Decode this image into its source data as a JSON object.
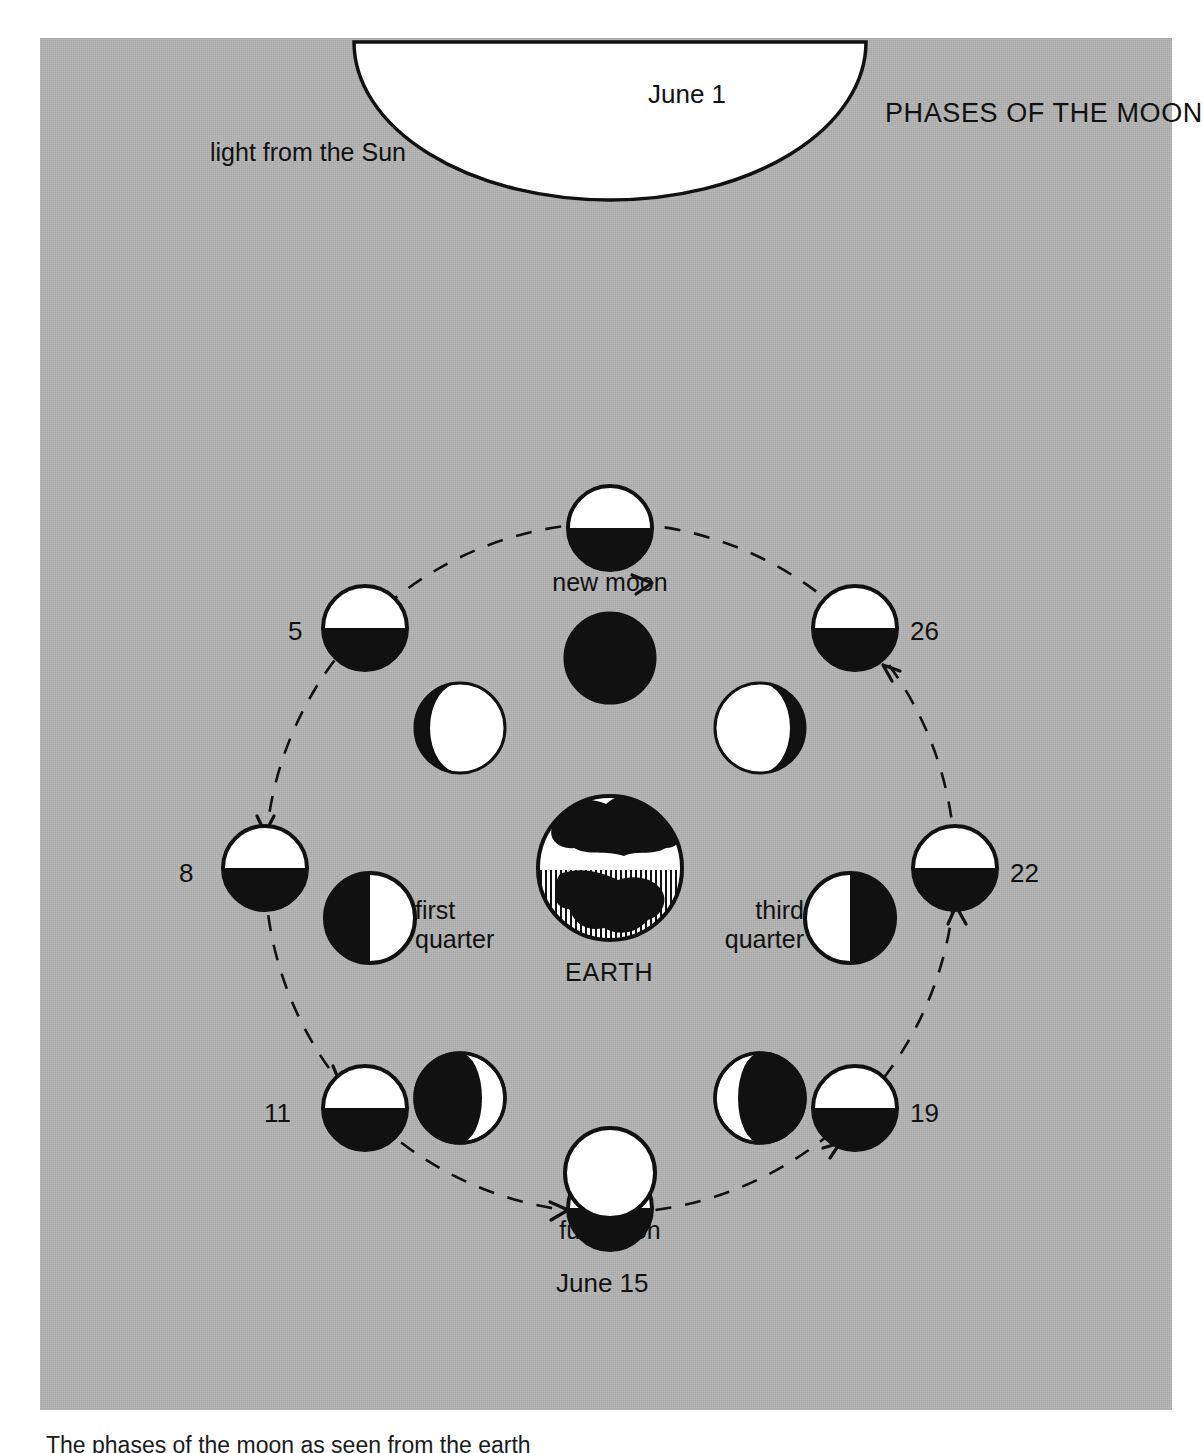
{
  "figure": {
    "title": "PHASES OF THE MOON",
    "sun_caption": "light from the Sun",
    "earth_label": "EARTH",
    "bottom_caption": "The phases of the moon as seen from the earth",
    "background_color": "#b3b3b3",
    "ink_color": "#111111",
    "lit_color": "#ffffff"
  },
  "orbit": {
    "center_x": 570,
    "center_y": 830,
    "radius_x": 345,
    "radius_y": 345,
    "style": "dashed",
    "direction": "counterclockwise"
  },
  "orbit_moons": [
    {
      "id": "orbit-june-1",
      "label": "June 1",
      "angle_deg": 90,
      "lit_half": "top",
      "label_side": "right",
      "cx": 570,
      "cy": 490
    },
    {
      "id": "orbit-day-5",
      "label": "5",
      "angle_deg": 135,
      "lit_half": "top",
      "label_side": "left",
      "cx": 325,
      "cy": 590
    },
    {
      "id": "orbit-day-8",
      "label": "8",
      "angle_deg": 180,
      "lit_half": "top",
      "label_side": "left",
      "cx": 225,
      "cy": 830
    },
    {
      "id": "orbit-day-11",
      "label": "11",
      "angle_deg": 225,
      "lit_half": "top",
      "label_side": "left",
      "cx": 325,
      "cy": 1070
    },
    {
      "id": "orbit-june-15",
      "label": "June 15",
      "angle_deg": 270,
      "lit_half": "top",
      "label_side": "below",
      "cx": 570,
      "cy": 1170
    },
    {
      "id": "orbit-day-19",
      "label": "19",
      "angle_deg": 315,
      "lit_half": "top",
      "label_side": "right",
      "cx": 815,
      "cy": 1070
    },
    {
      "id": "orbit-day-22",
      "label": "22",
      "angle_deg": 0,
      "lit_half": "top",
      "label_side": "right",
      "cx": 915,
      "cy": 830
    },
    {
      "id": "orbit-day-26",
      "label": "26",
      "angle_deg": 45,
      "lit_half": "top",
      "label_side": "right",
      "cx": 815,
      "cy": 590
    }
  ],
  "appearance_moons": [
    {
      "id": "phase-new-moon",
      "label": "new moon",
      "phase": "new",
      "lit_fraction": 0.0,
      "lit_side": "none",
      "cx": 570,
      "cy": 620
    },
    {
      "id": "phase-waxing-crescent",
      "label": "",
      "phase": "waxing crescent",
      "lit_fraction": 0.12,
      "lit_side": "right",
      "cx": 420,
      "cy": 690
    },
    {
      "id": "phase-first-quarter",
      "label": "first\nquarter",
      "phase": "first quarter",
      "lit_fraction": 0.5,
      "lit_side": "right",
      "cx": 330,
      "cy": 880
    },
    {
      "id": "phase-waxing-gibbous",
      "label": "",
      "phase": "waxing gibbous",
      "lit_fraction": 0.88,
      "lit_side": "right",
      "cx": 420,
      "cy": 1060
    },
    {
      "id": "phase-full-moon",
      "label": "full moon",
      "phase": "full",
      "lit_fraction": 1.0,
      "lit_side": "all",
      "cx": 570,
      "cy": 1135
    },
    {
      "id": "phase-waning-gibbous",
      "label": "",
      "phase": "waning gibbous",
      "lit_fraction": 0.88,
      "lit_side": "left",
      "cx": 720,
      "cy": 1060
    },
    {
      "id": "phase-third-quarter",
      "label": "third\nquarter",
      "phase": "third quarter",
      "lit_fraction": 0.5,
      "lit_side": "left",
      "cx": 810,
      "cy": 880
    },
    {
      "id": "phase-waning-crescent",
      "label": "",
      "phase": "waning crescent",
      "lit_fraction": 0.12,
      "lit_side": "left",
      "cx": 720,
      "cy": 690
    }
  ],
  "labels": {
    "june_1": "June 1",
    "day_5": "5",
    "day_8": "8",
    "day_11": "11",
    "june_15": "June 15",
    "day_19": "19",
    "day_22": "22",
    "day_26": "26",
    "new_moon": "new moon",
    "full_moon": "full moon",
    "first_quarter_line1": "first",
    "first_quarter_line2": "quarter",
    "third_quarter_line1": "third",
    "third_quarter_line2": "quarter"
  }
}
